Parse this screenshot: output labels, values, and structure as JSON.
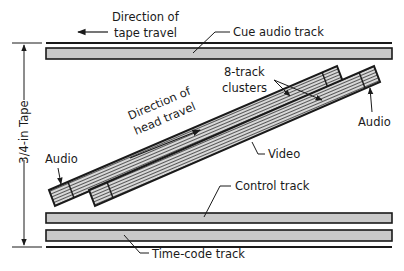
{
  "diagram": {
    "labels": {
      "tape_travel_line1": "Direction of",
      "tape_travel_line2": "tape travel",
      "cue_audio": "Cue audio track",
      "clusters_line1": "8-track",
      "clusters_line2": "clusters",
      "audio_right": "Audio",
      "audio_left": "Audio",
      "head_travel_line1": "Direction of",
      "head_travel_line2": "head travel",
      "video": "Video",
      "control": "Control track",
      "time_code": "Time-code track",
      "tape_width": "3/4-in Tape"
    },
    "colors": {
      "ink": "#1a1a1a",
      "track_fill": "#c9c9c9",
      "background": "#ffffff"
    }
  }
}
